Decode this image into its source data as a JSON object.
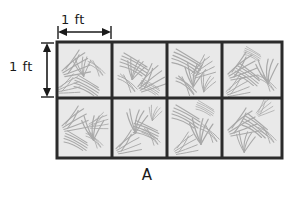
{
  "figure": {
    "name": "quadrat-sampling-grid",
    "caption_label": "A",
    "background_color": "#ffffff",
    "dimensions": {
      "horizontal": {
        "label": "1 ft",
        "orientation": "horizontal",
        "spans_cells": 1
      },
      "vertical": {
        "label": "1 ft",
        "orientation": "vertical",
        "spans_cells": 1
      }
    },
    "grid": {
      "columns": 4,
      "rows": 2,
      "total_cells": 8,
      "cell_width_ft": 1,
      "cell_height_ft": 1,
      "total_width_ft": 4,
      "total_height_ft": 2,
      "total_area_sq_ft": 8,
      "line_color": "#2b2b2b",
      "cell_fill_color": "#e9e9e9",
      "vegetation_stroke_color": "#9a9a9a",
      "cells": [
        {
          "row": 0,
          "col": 0,
          "name": "quadrat-cell-r0-c0"
        },
        {
          "row": 0,
          "col": 1,
          "name": "quadrat-cell-r0-c1"
        },
        {
          "row": 0,
          "col": 2,
          "name": "quadrat-cell-r0-c2"
        },
        {
          "row": 0,
          "col": 3,
          "name": "quadrat-cell-r0-c3"
        },
        {
          "row": 1,
          "col": 0,
          "name": "quadrat-cell-r1-c0"
        },
        {
          "row": 1,
          "col": 1,
          "name": "quadrat-cell-r1-c1"
        },
        {
          "row": 1,
          "col": 2,
          "name": "quadrat-cell-r1-c2"
        },
        {
          "row": 1,
          "col": 3,
          "name": "quadrat-cell-r1-c3"
        }
      ]
    }
  }
}
